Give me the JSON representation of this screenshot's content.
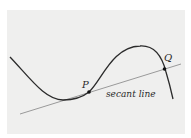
{
  "figure": {
    "labels": {
      "point_p": "P",
      "point_q": "Q",
      "secant": "secant line"
    },
    "colors": {
      "background": "#efefee",
      "curve": "#2b2b2b",
      "secant": "#9a9a9a",
      "point": "#111111"
    }
  }
}
